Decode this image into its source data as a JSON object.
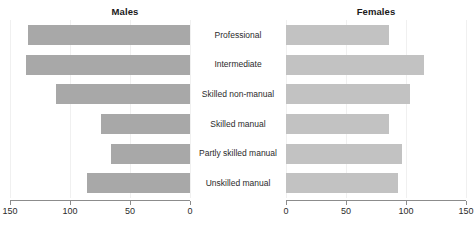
{
  "chart_data": {
    "type": "bar",
    "subtype": "diverging-bar-pyramid",
    "title": "",
    "categories": [
      "Professional",
      "Intermediate",
      "Skilled non-manual",
      "Skilled manual",
      "Partly skilled manual",
      "Unskilled manual"
    ],
    "series": [
      {
        "name": "Males",
        "direction": "left",
        "color": "#a8a8a8",
        "values": [
          135,
          137,
          112,
          74,
          66,
          86
        ]
      },
      {
        "name": "Females",
        "direction": "right",
        "color": "#c2c2c2",
        "values": [
          86,
          115,
          103,
          86,
          97,
          93
        ]
      }
    ],
    "xlabel": "",
    "ylabel": "",
    "xlim_left": [
      150,
      0
    ],
    "xlim_right": [
      0,
      150
    ],
    "left_ticks": [
      150,
      100,
      50,
      0
    ],
    "left_tick_labels": [
      "150",
      "100",
      "50",
      "0"
    ],
    "right_ticks": [
      0,
      50,
      100,
      150
    ],
    "right_tick_labels": [
      "0",
      "50",
      "100",
      "150"
    ],
    "grid": false,
    "legend": "none"
  },
  "panels": {
    "left_title": "Males",
    "right_title": "Females"
  }
}
